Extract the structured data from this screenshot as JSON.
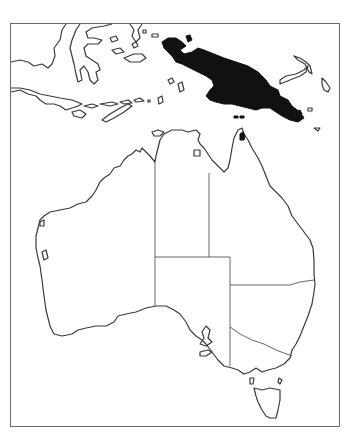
{
  "map": {
    "title": "Distribution map: New Guinea and northern Cape York",
    "region": "Australia, New Guinea and eastern Indonesia",
    "highlighted_range": [
      "New Guinea",
      "Tip of Cape York Peninsula"
    ],
    "colors": {
      "range_fill": "#111111",
      "coastline": "#3a3a3a",
      "background": "#ffffff",
      "frame": "#6a6a6a"
    },
    "layers": [
      "frame",
      "coastlines",
      "state-borders",
      "range-fill"
    ]
  }
}
